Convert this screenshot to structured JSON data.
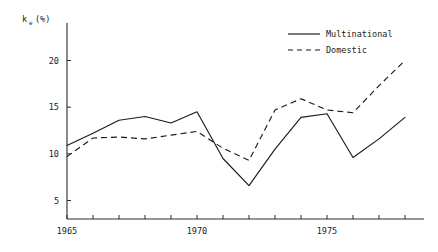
{
  "chart_data": {
    "type": "line",
    "title": "",
    "xlabel": "",
    "ylabel": "k_e (%)",
    "ylabel_base": "k",
    "ylabel_sub": "e",
    "ylabel_unit": "(%)",
    "x": [
      1965,
      1966,
      1967,
      1968,
      1969,
      1970,
      1971,
      1972,
      1973,
      1974,
      1975,
      1976,
      1977,
      1978
    ],
    "xlim": [
      1964.5,
      1978.5
    ],
    "ylim": [
      0,
      22
    ],
    "yticks": [
      5,
      10,
      15,
      20
    ],
    "ytick_labels": [
      "5",
      "10",
      "15",
      "20"
    ],
    "xticks": [
      1965,
      1966,
      1967,
      1968,
      1969,
      1970,
      1971,
      1972,
      1973,
      1974,
      1975,
      1976,
      1977,
      1978
    ],
    "xtick_labels_shown": [
      "1965",
      "1970",
      "1975"
    ],
    "xtick_labels_shown_at": [
      1965,
      1970,
      1975
    ],
    "grid": false,
    "legend_position": "top-right",
    "series": [
      {
        "name": "Multinational",
        "style": "solid",
        "values": [
          10.9,
          12.2,
          13.6,
          14.0,
          13.3,
          14.5,
          9.5,
          6.6,
          10.5,
          13.9,
          14.3,
          9.6,
          11.6,
          13.9
        ]
      },
      {
        "name": "Domestic",
        "style": "dashed",
        "values": [
          9.7,
          11.7,
          11.8,
          11.6,
          12.0,
          12.4,
          10.6,
          9.3,
          14.7,
          15.9,
          14.7,
          14.4,
          17.3,
          20.0
        ]
      }
    ]
  },
  "legend": {
    "items": [
      {
        "label": "Multinational",
        "style": "solid"
      },
      {
        "label": "Domestic",
        "style": "dashed"
      }
    ]
  }
}
